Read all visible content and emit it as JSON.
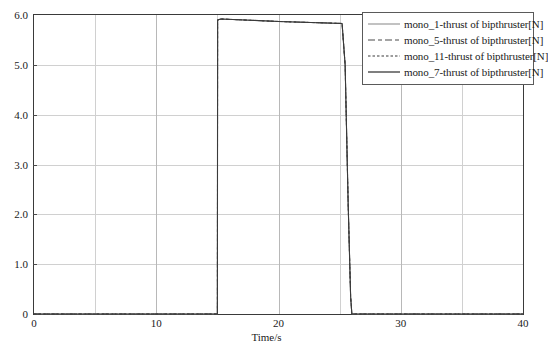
{
  "chart_data": {
    "type": "line",
    "title": "",
    "xlabel": "Time/s",
    "ylabel": "",
    "xlim": [
      0,
      40
    ],
    "ylim": [
      0,
      6.0
    ],
    "grid": true,
    "legend_position": "top-right",
    "xticks": [
      "0",
      "10",
      "20",
      "30",
      "40"
    ],
    "xtick_values": [
      0,
      10,
      20,
      30,
      40
    ],
    "yticks": [
      "0",
      "1.0",
      "2.0",
      "3.0",
      "4.0",
      "5.0",
      "6.0"
    ],
    "ytick_values": [
      0,
      1.0,
      2.0,
      3.0,
      4.0,
      5.0,
      6.0
    ],
    "minor_xtick_values": [
      5,
      15,
      25,
      35
    ],
    "series": [
      {
        "name": "mono_1-thrust of bipthruster[N]",
        "style": "solid",
        "color": "#9a9a9a",
        "width": 1.0,
        "x": [
          0,
          15.0,
          15.02,
          15.3,
          20,
          25.2,
          25.45,
          25.7,
          25.9,
          26.0,
          40
        ],
        "y": [
          0,
          0,
          5.9,
          5.92,
          5.87,
          5.83,
          5.0,
          2.2,
          0.35,
          0,
          0
        ]
      },
      {
        "name": "mono_5-thrust of bipthruster[N]",
        "style": "dashed",
        "color": "#4a4a4a",
        "width": 1.0,
        "x": [
          0,
          15.0,
          15.02,
          15.3,
          20,
          25.2,
          25.45,
          25.7,
          25.9,
          26.0,
          40
        ],
        "y": [
          0,
          0,
          5.9,
          5.92,
          5.87,
          5.83,
          5.0,
          2.2,
          0.35,
          0,
          0
        ]
      },
      {
        "name": "mono_11-thrust of bipthruster[N]",
        "style": "dotted",
        "color": "#3a3a3a",
        "width": 1.0,
        "x": [
          0,
          15.0,
          15.02,
          15.3,
          20,
          25.2,
          25.45,
          25.7,
          25.9,
          26.0,
          40
        ],
        "y": [
          0,
          0,
          5.9,
          5.92,
          5.87,
          5.83,
          5.0,
          2.2,
          0.35,
          0,
          0
        ]
      },
      {
        "name": "mono_7-thrust of bipthruster[N]",
        "style": "solid",
        "color": "#3a3a3a",
        "width": 1.1,
        "x": [
          0,
          15.0,
          15.02,
          15.3,
          20,
          25.2,
          25.45,
          25.7,
          25.9,
          26.0,
          40
        ],
        "y": [
          0,
          0,
          5.9,
          5.92,
          5.87,
          5.83,
          5.0,
          2.2,
          0.35,
          0,
          0
        ]
      }
    ]
  },
  "legend": {
    "entries": [
      {
        "label": "mono_1-thrust of bipthruster[N]"
      },
      {
        "label": "mono_5-thrust of bipthruster[N]"
      },
      {
        "label": "mono_11-thrust of bipthruster[N]"
      },
      {
        "label": "mono_7-thrust of bipthruster[N]"
      }
    ]
  },
  "axes": {
    "x_title": "Time/s"
  }
}
